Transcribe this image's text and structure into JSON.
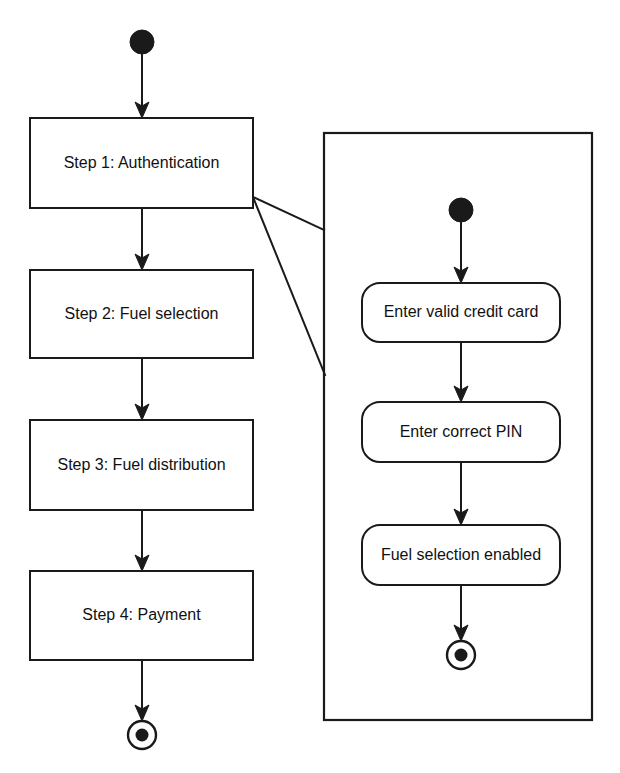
{
  "diagram": {
    "type": "uml-activity-diagram",
    "title": "",
    "background_color": "#ffffff",
    "line_color": "#1a1a1a",
    "text_color": "#111111"
  },
  "main_flow": {
    "initial_node": {
      "label": "initial-node",
      "cx": 142,
      "cy": 42,
      "r": 12
    },
    "activities": [
      {
        "id": "step1",
        "label": "Step 1: Authentication",
        "x": 30,
        "y": 118,
        "w": 223,
        "h": 90,
        "shape": "rectangle"
      },
      {
        "id": "step2",
        "label": "Step 2: Fuel selection",
        "x": 30,
        "y": 270,
        "w": 223,
        "h": 88,
        "shape": "rectangle"
      },
      {
        "id": "step3",
        "label": "Step 3: Fuel distribution",
        "x": 30,
        "y": 420,
        "w": 223,
        "h": 90,
        "shape": "rectangle"
      },
      {
        "id": "step4",
        "label": "Step 4: Payment",
        "x": 30,
        "y": 571,
        "w": 223,
        "h": 89,
        "shape": "rectangle"
      }
    ],
    "final_node": {
      "label": "final-node",
      "cx": 142,
      "cy": 735,
      "outer_r": 14,
      "inner_r": 6.5
    },
    "transitions": [
      {
        "from": "initial-node",
        "to": "step1"
      },
      {
        "from": "step1",
        "to": "step2"
      },
      {
        "from": "step2",
        "to": "step3"
      },
      {
        "from": "step3",
        "to": "step4"
      },
      {
        "from": "step4",
        "to": "final-node"
      }
    ]
  },
  "detail_panel": {
    "describes": "step1",
    "frame": {
      "x": 324,
      "y": 133,
      "w": 268,
      "h": 587
    },
    "initial_node": {
      "label": "initial-node",
      "cx": 461,
      "cy": 210,
      "r": 12
    },
    "activities": [
      {
        "id": "detail1",
        "label": "Enter valid credit card",
        "x": 362,
        "y": 283,
        "w": 198,
        "h": 59,
        "shape": "rounded-rectangle"
      },
      {
        "id": "detail2",
        "label": "Enter correct PIN",
        "x": 362,
        "y": 402,
        "w": 198,
        "h": 60,
        "shape": "rounded-rectangle"
      },
      {
        "id": "detail3",
        "label": "Fuel selection enabled",
        "x": 362,
        "y": 525,
        "w": 198,
        "h": 60,
        "shape": "rounded-rectangle"
      }
    ],
    "final_node": {
      "label": "final-node",
      "cx": 461,
      "cy": 655,
      "outer_r": 14,
      "inner_r": 6.5
    },
    "transitions": [
      {
        "from": "initial-node",
        "to": "detail1"
      },
      {
        "from": "detail1",
        "to": "detail2"
      },
      {
        "from": "detail2",
        "to": "detail3"
      },
      {
        "from": "detail3",
        "to": "final-node"
      }
    ]
  },
  "callout": {
    "label": "callout-wedge",
    "apex_x": 253,
    "apex_y": 197,
    "upper_x": 324,
    "upper_y": 230,
    "lower_x": 325,
    "lower_y": 375
  }
}
